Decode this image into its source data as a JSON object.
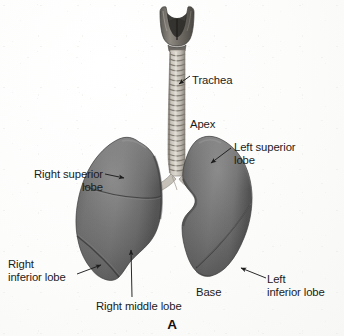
{
  "figure": {
    "letter": "A"
  },
  "colors": {
    "background": "#fdfdfc",
    "lung_tissue_mid": "#6e6e6e",
    "lung_tissue_light": "#8d8d8d",
    "lung_tissue_dark": "#4a4a4a",
    "lung_edge_shadow": "#3a3a3a",
    "trachea_light": "#cfcac2",
    "trachea_ring_dark": "#8d8880",
    "larynx_dark": "#4f4c48",
    "label_text": "#1b1b1b",
    "leader_line": "#2a2a2a"
  },
  "labels": {
    "trachea": {
      "text": "Trachea",
      "align": "left-align",
      "x": 192,
      "y": 74
    },
    "apex": {
      "text": "Apex",
      "align": "left-align",
      "x": 190,
      "y": 118
    },
    "left_superior_lobe": {
      "text": "Left superior\nlobe",
      "align": "left-align",
      "x": 234,
      "y": 141
    },
    "right_superior_lobe": {
      "text": "Right superior\nlobe",
      "align": "right-align",
      "x": 19,
      "y": 168
    },
    "right_inferior_lobe": {
      "text": "Right\ninferior lobe",
      "align": "left-align",
      "x": 8,
      "y": 258
    },
    "right_middle_lobe": {
      "text": "Right middle lobe",
      "align": "left-align",
      "x": 96,
      "y": 300
    },
    "base": {
      "text": "Base",
      "align": "left-align",
      "x": 196,
      "y": 286
    },
    "left_inferior_lobe": {
      "text": "Left\ninferior lobe",
      "align": "left-align",
      "x": 267,
      "y": 273
    }
  },
  "anatomy_parts": [
    "larynx",
    "trachea",
    "right-main-bronchus",
    "left-main-bronchus",
    "right-superior-lobe",
    "right-middle-lobe",
    "right-inferior-lobe",
    "left-superior-lobe",
    "left-inferior-lobe",
    "horizontal-fissure",
    "oblique-fissure-right",
    "oblique-fissure-left",
    "cardiac-notch"
  ]
}
